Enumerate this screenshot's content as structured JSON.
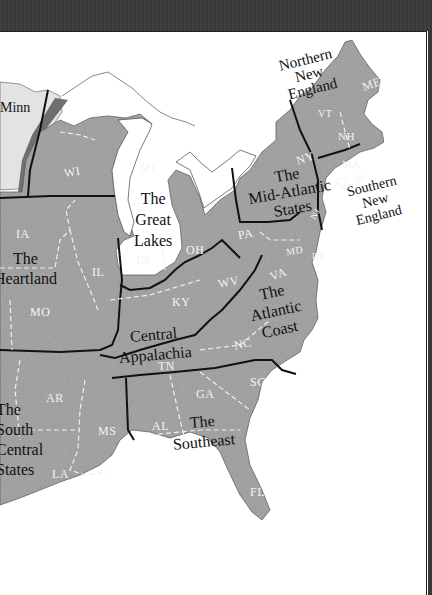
{
  "map": {
    "title": "Eastern United States Regions",
    "colors": {
      "land": "#9a9a9a",
      "land_light": "#d8d8d8",
      "minnesota_strip": "#6f6f6f",
      "border": "#111111",
      "state_dash": "#f0f0f0",
      "water": "#ffffff",
      "frame": "#3a3a3a"
    },
    "regions": [
      {
        "id": "northern-new-england",
        "label": "Northern\nNew\nEngland"
      },
      {
        "id": "southern-new-england",
        "label": "Southern\nNew\nEngland"
      },
      {
        "id": "mid-atlantic",
        "label": "The\nMid-Atlantic\nStates"
      },
      {
        "id": "great-lakes",
        "label": "The\nGreat\nLakes"
      },
      {
        "id": "heartland",
        "label": "The\nHeartland"
      },
      {
        "id": "central-appalachia",
        "label": "Central\nAppalachia"
      },
      {
        "id": "atlantic-coast",
        "label": "The\nAtlantic\nCoast"
      },
      {
        "id": "south-central",
        "label": "The\nSouth\nCentral\nStates"
      },
      {
        "id": "southeast",
        "label": "The\nSoutheast"
      }
    ],
    "partial_label": "Minn",
    "states": [
      {
        "abbr": "ME"
      },
      {
        "abbr": "VT"
      },
      {
        "abbr": "NH"
      },
      {
        "abbr": "MA"
      },
      {
        "abbr": "CT"
      },
      {
        "abbr": "RI"
      },
      {
        "abbr": "NY"
      },
      {
        "abbr": "PA"
      },
      {
        "abbr": "NJ"
      },
      {
        "abbr": "DE"
      },
      {
        "abbr": "MD"
      },
      {
        "abbr": "MI"
      },
      {
        "abbr": "WI"
      },
      {
        "abbr": "OH"
      },
      {
        "abbr": "IN"
      },
      {
        "abbr": "IL"
      },
      {
        "abbr": "IA"
      },
      {
        "abbr": "MO"
      },
      {
        "abbr": "KY"
      },
      {
        "abbr": "WV"
      },
      {
        "abbr": "TN"
      },
      {
        "abbr": "VA"
      },
      {
        "abbr": "NC"
      },
      {
        "abbr": "SC"
      },
      {
        "abbr": "GA"
      },
      {
        "abbr": "AL"
      },
      {
        "abbr": "MS"
      },
      {
        "abbr": "AR"
      },
      {
        "abbr": "LA"
      },
      {
        "abbr": "FL"
      }
    ]
  }
}
